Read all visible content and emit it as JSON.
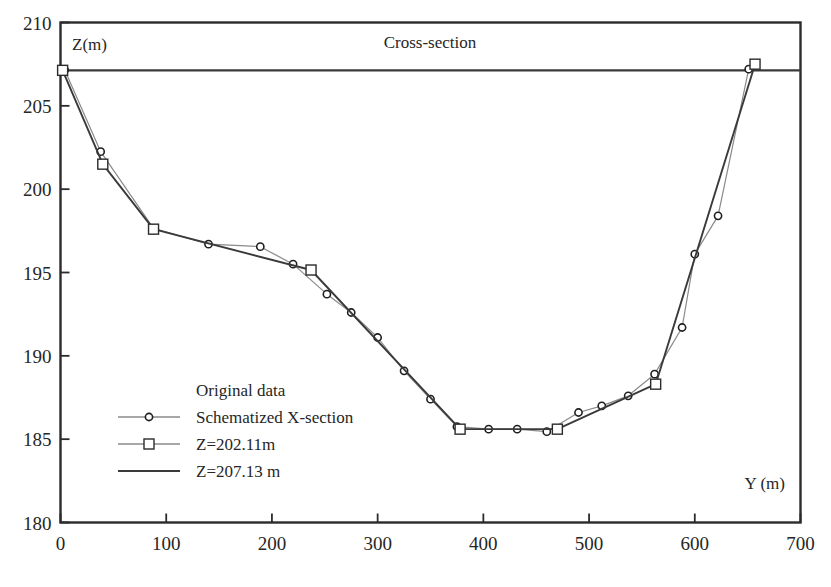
{
  "chart_data": {
    "type": "line",
    "title": "Cross-section",
    "xlabel": "Y (m)",
    "ylabel": "Z(m)",
    "xlim": [
      0,
      700
    ],
    "ylim": [
      180,
      210
    ],
    "xticks": [
      0,
      100,
      200,
      300,
      400,
      500,
      600,
      700
    ],
    "yticks": [
      180,
      185,
      190,
      195,
      200,
      205,
      210
    ],
    "grid": false,
    "legend_position": "center-left",
    "legend": [
      {
        "label": "Original data",
        "marker": "none",
        "line": "none"
      },
      {
        "label": "Schematized X-section",
        "marker": "circle",
        "line": "thin"
      },
      {
        "label": "Z=202.11m",
        "marker": "square",
        "line": "thin"
      },
      {
        "label": "Z=207.13 m",
        "marker": "none",
        "line": "thick"
      }
    ],
    "series": [
      {
        "name": "Original data",
        "marker": "circle",
        "points": [
          {
            "x": 4,
            "y": 207.15
          },
          {
            "x": 38,
            "y": 202.25
          },
          {
            "x": 88,
            "y": 197.65
          },
          {
            "x": 140,
            "y": 196.7
          },
          {
            "x": 189,
            "y": 196.55
          },
          {
            "x": 220,
            "y": 195.5
          },
          {
            "x": 252,
            "y": 193.7
          },
          {
            "x": 275,
            "y": 192.6
          },
          {
            "x": 300,
            "y": 191.1
          },
          {
            "x": 325,
            "y": 189.1
          },
          {
            "x": 350,
            "y": 187.4
          },
          {
            "x": 375,
            "y": 185.75
          },
          {
            "x": 405,
            "y": 185.6
          },
          {
            "x": 432,
            "y": 185.6
          },
          {
            "x": 460,
            "y": 185.45
          },
          {
            "x": 490,
            "y": 186.6
          },
          {
            "x": 512,
            "y": 187.0
          },
          {
            "x": 537,
            "y": 187.6
          },
          {
            "x": 562,
            "y": 188.9
          },
          {
            "x": 588,
            "y": 191.7
          },
          {
            "x": 600,
            "y": 196.1
          },
          {
            "x": 622,
            "y": 198.4
          },
          {
            "x": 651,
            "y": 207.2
          }
        ]
      },
      {
        "name": "Schematized X-section",
        "marker": "square",
        "points": [
          {
            "x": 2,
            "y": 207.13
          },
          {
            "x": 40,
            "y": 201.5
          },
          {
            "x": 88,
            "y": 197.6
          },
          {
            "x": 237,
            "y": 195.15
          },
          {
            "x": 378,
            "y": 185.6
          },
          {
            "x": 470,
            "y": 185.6
          },
          {
            "x": 563,
            "y": 188.3
          },
          {
            "x": 657,
            "y": 207.5
          }
        ]
      }
    ],
    "reference_lines": [
      {
        "name": "Z=207.13 m",
        "value": 207.13,
        "orientation": "horizontal"
      }
    ]
  }
}
